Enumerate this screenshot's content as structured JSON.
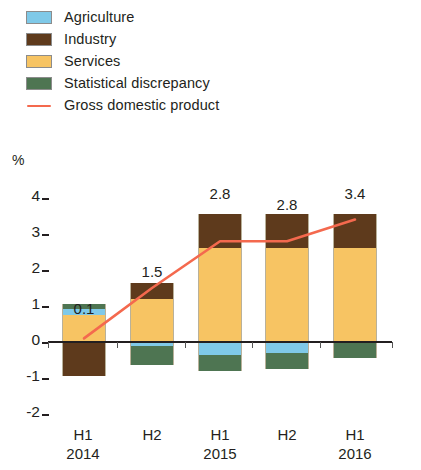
{
  "legend": {
    "items": [
      {
        "label": "Agriculture",
        "color": "#7FC9E8",
        "type": "swatch",
        "icon": "color-swatch"
      },
      {
        "label": "Industry",
        "color": "#5E3A1C",
        "type": "swatch",
        "icon": "color-swatch"
      },
      {
        "label": "Services",
        "color": "#F7C463",
        "type": "swatch",
        "icon": "color-swatch"
      },
      {
        "label": "Statistical discrepancy",
        "color": "#4E7552",
        "type": "swatch",
        "icon": "color-swatch"
      },
      {
        "label": "Gross domestic product",
        "color": "#F4694E",
        "type": "line",
        "icon": "line-swatch"
      }
    ]
  },
  "axis": {
    "unit_label": "%",
    "y_ticks": [
      "4",
      "3",
      "2",
      "1",
      "0",
      "-1",
      "-2"
    ],
    "x_labels": [
      {
        "period": "H1",
        "year": "2014"
      },
      {
        "period": "H2",
        "year": ""
      },
      {
        "period": "H1",
        "year": "2015"
      },
      {
        "period": "H2",
        "year": ""
      },
      {
        "period": "H1",
        "year": "2016"
      }
    ]
  },
  "chart_data": {
    "type": "bar",
    "title": "",
    "subtitle": "",
    "xlabel": "",
    "ylabel": "%",
    "ylim": [
      -2,
      4
    ],
    "grid": false,
    "legend_position": "top-left",
    "stacked": true,
    "categories": [
      "H1 2014",
      "H2 2014",
      "H1 2015",
      "H2 2015",
      "H1 2016"
    ],
    "series": [
      {
        "name": "Agriculture",
        "color": "#7FC9E8",
        "values": [
          0.18,
          -0.1,
          -0.35,
          -0.3,
          0.0
        ]
      },
      {
        "name": "Industry",
        "color": "#5E3A1C",
        "values": [
          -0.95,
          0.45,
          0.95,
          0.95,
          0.95
        ]
      },
      {
        "name": "Services",
        "color": "#F7C463",
        "values": [
          0.75,
          1.2,
          2.6,
          2.6,
          2.6
        ]
      },
      {
        "name": "Statistical discrepancy",
        "color": "#4E7552",
        "values": [
          0.12,
          -0.55,
          -0.45,
          -0.45,
          -0.45
        ]
      }
    ],
    "line_series": {
      "name": "Gross domestic product",
      "color": "#F4694E",
      "values": [
        0.1,
        1.5,
        2.8,
        2.8,
        3.4
      ],
      "labels": [
        "0.1",
        "1.5",
        "2.8",
        "2.8",
        "3.4"
      ]
    }
  },
  "colors": {
    "agriculture": "#7FC9E8",
    "industry": "#5E3A1C",
    "services": "#F7C463",
    "statistical_discrepancy": "#4E7552",
    "gdp_line": "#F4694E",
    "axis": "#231f20"
  }
}
